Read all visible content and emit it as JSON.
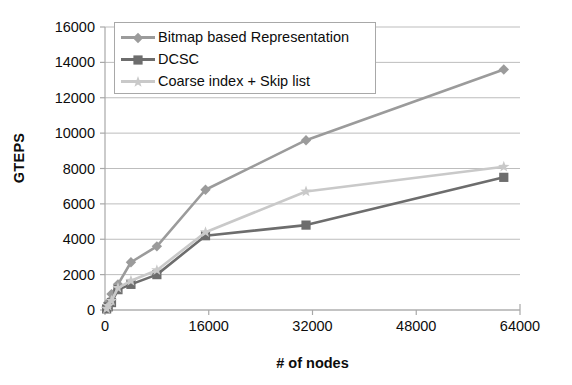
{
  "chart_data": {
    "type": "line",
    "title": "",
    "xlabel": "# of nodes",
    "ylabel": "GTEPS",
    "xlim": [
      0,
      64000
    ],
    "ylim": [
      0,
      16000
    ],
    "grid": true,
    "legend_position": "top-left-inside",
    "x_ticks": [
      "0",
      "16000",
      "32000",
      "48000",
      "64000"
    ],
    "x_tick_values": [
      0,
      16000,
      32000,
      48000,
      64000
    ],
    "y_ticks": [
      "0",
      "2000",
      "4000",
      "6000",
      "8000",
      "10000",
      "12000",
      "14000",
      "16000"
    ],
    "y_tick_values": [
      0,
      2000,
      4000,
      6000,
      8000,
      10000,
      12000,
      14000,
      16000
    ],
    "series": [
      {
        "name": "Bitmap based Representation",
        "color": "#9b9b9b",
        "marker": "diamond",
        "x": [
          250,
          500,
          1000,
          2000,
          4000,
          8000,
          15500,
          31000,
          61500
        ],
        "values": [
          150,
          420,
          900,
          1450,
          2700,
          3600,
          6800,
          9600,
          13600
        ]
      },
      {
        "name": "DCSC",
        "color": "#6d6d6d",
        "marker": "square",
        "x": [
          250,
          500,
          1000,
          2000,
          4000,
          8000,
          15500,
          31000,
          61500
        ],
        "values": [
          60,
          180,
          420,
          1150,
          1450,
          2000,
          4200,
          4800,
          7500
        ]
      },
      {
        "name": "Coarse index + Skip list",
        "color": "#c9c9c9",
        "marker": "star",
        "x": [
          250,
          500,
          1000,
          2000,
          4000,
          8000,
          15500,
          31000,
          61500
        ],
        "values": [
          80,
          230,
          520,
          1250,
          1650,
          2250,
          4400,
          6700,
          8100
        ]
      }
    ]
  },
  "axes": {
    "y_title": "GTEPS",
    "x_title": "# of nodes"
  },
  "legend": {
    "items": [
      {
        "label": "Bitmap based Representation",
        "color": "#9b9b9b",
        "marker": "diamond"
      },
      {
        "label": "DCSC",
        "color": "#6d6d6d",
        "marker": "square"
      },
      {
        "label": "Coarse index + Skip list",
        "color": "#c9c9c9",
        "marker": "star"
      }
    ]
  },
  "style": {
    "axis_color": "#a8a8a8",
    "grid_color": "#bdbdbd",
    "text_color": "#0d0d0d",
    "background": "#ffffff"
  }
}
